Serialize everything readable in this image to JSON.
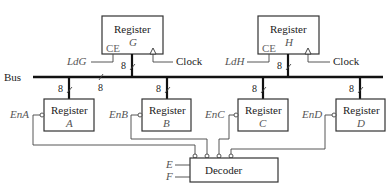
{
  "diagram": {
    "bus_label": "Bus",
    "bus_width_label": "8",
    "top_registers": [
      {
        "title": "Register",
        "name": "G",
        "ce_label": "CE",
        "load_signal": "LdG",
        "clock_label": "Clock",
        "width": "8"
      },
      {
        "title": "Register",
        "name": "H",
        "ce_label": "CE",
        "load_signal": "LdH",
        "clock_label": "Clock",
        "width": "8"
      }
    ],
    "bottom_registers": [
      {
        "title": "Register",
        "name": "A",
        "enable_signal": "EnA",
        "width": "8"
      },
      {
        "title": "Register",
        "name": "B",
        "enable_signal": "EnB",
        "width": "8"
      },
      {
        "title": "Register",
        "name": "C",
        "enable_signal": "EnC",
        "width": "8"
      },
      {
        "title": "Register",
        "name": "D",
        "enable_signal": "EnD",
        "width": "8"
      }
    ],
    "decoder": {
      "label": "Decoder",
      "inputs": [
        "E",
        "F"
      ]
    }
  }
}
